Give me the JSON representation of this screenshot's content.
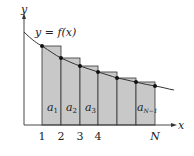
{
  "diagram": {
    "curve_label": "y = f(x)",
    "axis_x_label": "x",
    "axis_y_label": "y",
    "x_ticks": [
      "1",
      "2",
      "3",
      "4",
      "N"
    ],
    "area_labels": [
      {
        "base": "a",
        "sub": "1"
      },
      {
        "base": "a",
        "sub": "2"
      },
      {
        "base": "a",
        "sub": "3"
      },
      {
        "base": "a",
        "sub": "N−1"
      }
    ],
    "colors": {
      "rect_fill": "#c8c8c8",
      "rect_stroke": "#333333",
      "curve": "#333333",
      "dot": "#111111",
      "axis": "#333333"
    }
  }
}
